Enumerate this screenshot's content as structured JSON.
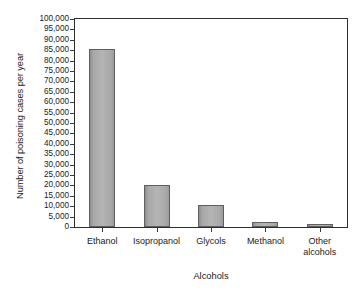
{
  "chart_data": {
    "type": "bar",
    "title": "",
    "xlabel": "Alcohols",
    "ylabel": "Number of poisoning cases per year",
    "categories": [
      "Ethanol",
      "Isopropanol",
      "Glycols",
      "Methanol",
      "Other alcohols"
    ],
    "category_lines": [
      [
        "Ethanol"
      ],
      [
        "Isopropanol"
      ],
      [
        "Glycols"
      ],
      [
        "Methanol"
      ],
      [
        "Other",
        "alcohols"
      ]
    ],
    "values": [
      85500,
      20000,
      10500,
      2200,
      1300
    ],
    "ylim": [
      0,
      100000
    ],
    "ytick_step": 5000,
    "yticks": [
      0,
      5000,
      10000,
      15000,
      20000,
      25000,
      30000,
      35000,
      40000,
      45000,
      50000,
      55000,
      60000,
      65000,
      70000,
      75000,
      80000,
      85000,
      90000,
      95000,
      100000
    ],
    "ytick_labels": [
      "0",
      "5,000",
      "10,000",
      "15,000",
      "20,000",
      "25,000",
      "30,000",
      "35,000",
      "40,000",
      "45,000",
      "50,000",
      "55,000",
      "60,000",
      "65,000",
      "70,000",
      "75,000",
      "80,000",
      "85,000",
      "90,000",
      "95,000",
      "100,000"
    ],
    "grid": false,
    "legend": null,
    "bar_fill_color": "#b0b0b0",
    "bar_edge_color": "#5f5f5f",
    "axis_color": "#2e2e2e",
    "background_color": "#ffffff"
  }
}
